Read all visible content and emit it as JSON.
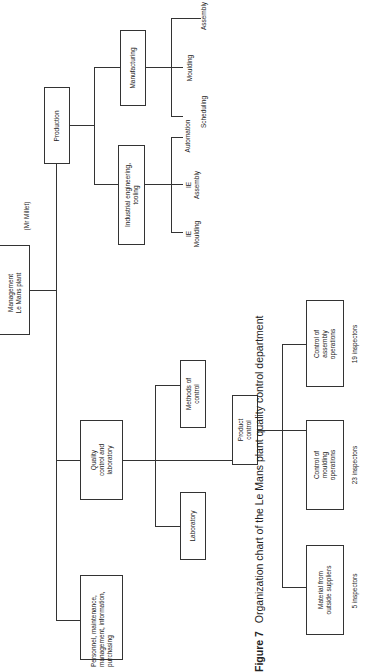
{
  "caption": {
    "figure": "Figure 7",
    "text": "Organization chart of the Le Mans plant quality control department"
  },
  "nodes": {
    "management": {
      "line1": "Management",
      "line2": "Le Mans plant",
      "note": "(Mr Millet)"
    },
    "production": {
      "label": "Production"
    },
    "industrial_engineering": {
      "line1": "Industrial engineering,",
      "line2": "tooling"
    },
    "manufacturing": {
      "label": "Manufacturing"
    },
    "ie_moulding": {
      "line1": "IE",
      "line2": "Moulding"
    },
    "ie_assembly": {
      "line1": "IE",
      "line2": "Assembly"
    },
    "automation": {
      "label": "Automation"
    },
    "scheduling": {
      "label": "Scheduling"
    },
    "moulding": {
      "label": "Moulding"
    },
    "assembly": {
      "label": "Assembly"
    },
    "quality": {
      "line1": "Quality",
      "line2": "control and",
      "line3": "laboratory"
    },
    "laboratory": {
      "label": "Laboratory"
    },
    "methods": {
      "line1": "Methods of",
      "line2": "control"
    },
    "product_control": {
      "line1": "Product",
      "line2": "control"
    },
    "material_suppliers": {
      "line1": "Material from",
      "line2": "outside suppliers",
      "count": "5 inspectors"
    },
    "moulding_ops": {
      "line1": "Control of",
      "line2": "moulding",
      "line3": "operations",
      "count": "23 inspectors"
    },
    "assembly_ops": {
      "line1": "Control of",
      "line2": "assembly",
      "line3": "operations",
      "count": "19 inspectors"
    },
    "personnel": {
      "line1": "Personnel, maintenance,",
      "line2": "management, information,",
      "line3": "purchasing"
    }
  }
}
